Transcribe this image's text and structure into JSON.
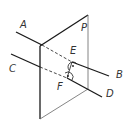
{
  "diagram": {
    "type": "geometry",
    "labels": {
      "A": "A",
      "B": "B",
      "C": "C",
      "D": "D",
      "E": "E",
      "F": "F",
      "P": "P"
    },
    "colors": {
      "line": "#1a1a1a",
      "plane_edge": "#555555",
      "label": "#333333"
    }
  }
}
